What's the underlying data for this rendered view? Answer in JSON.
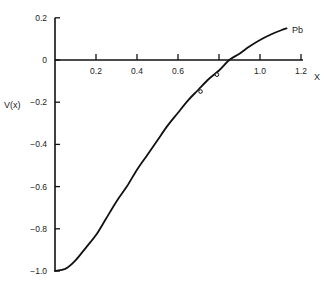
{
  "chart_data": {
    "type": "line",
    "title": "",
    "xlabel": "X",
    "ylabel": "V(x)",
    "xlim": [
      0,
      1.2
    ],
    "ylim": [
      -1.0,
      0.2
    ],
    "grid": false,
    "legend": "none",
    "x_ticks": [
      {
        "value": 0.2,
        "label": "0.2"
      },
      {
        "value": 0.4,
        "label": "0.4"
      },
      {
        "value": 0.6,
        "label": "0.6"
      },
      {
        "value": 0.8,
        "label": ""
      },
      {
        "value": 1.0,
        "label": "1.0"
      },
      {
        "value": 1.2,
        "label": "1.2"
      }
    ],
    "y_ticks": [
      {
        "value": 0.2,
        "label": "0.2"
      },
      {
        "value": 0,
        "label": "0"
      },
      {
        "value": -0.2,
        "label": "-0.2"
      },
      {
        "value": -0.4,
        "label": "-0.4"
      },
      {
        "value": -0.6,
        "label": "-0.6"
      },
      {
        "value": -0.8,
        "label": "-0.8"
      },
      {
        "value": -1.0,
        "label": "-1.0"
      }
    ],
    "series": [
      {
        "name": "Pb",
        "style": "solid",
        "x": [
          0.0,
          0.05,
          0.1,
          0.15,
          0.2,
          0.25,
          0.3,
          0.35,
          0.4,
          0.45,
          0.5,
          0.55,
          0.6,
          0.65,
          0.7,
          0.75,
          0.8,
          0.85,
          0.9,
          0.95,
          1.0,
          1.05,
          1.1,
          1.13
        ],
        "y": [
          -1.0,
          -0.99,
          -0.95,
          -0.89,
          -0.83,
          -0.75,
          -0.67,
          -0.6,
          -0.52,
          -0.45,
          -0.38,
          -0.31,
          -0.25,
          -0.19,
          -0.14,
          -0.09,
          -0.05,
          0.0,
          0.03,
          0.065,
          0.095,
          0.12,
          0.14,
          0.15
        ]
      },
      {
        "name": "data points",
        "style": "open-circle-markers",
        "x": [
          0.71,
          0.79
        ],
        "y": [
          -0.14,
          -0.06
        ]
      }
    ],
    "annotations": [
      {
        "text": "Pb",
        "x": 1.15,
        "y": 0.15
      }
    ]
  }
}
